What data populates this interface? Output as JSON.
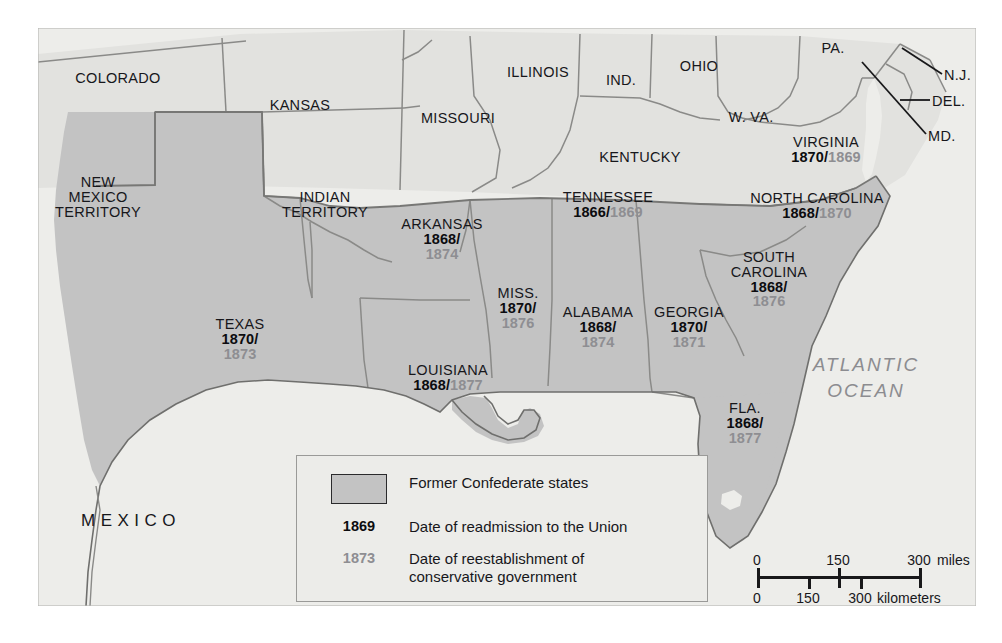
{
  "map": {
    "title": "Reconstruction: Former Confederate States",
    "colors": {
      "confederate_fill": "#c3c3c3",
      "union_fill": "#e2e2df",
      "ocean_fill": "#ededea",
      "border_line": "#8a8a88",
      "label_dark": "#17171b",
      "label_gray": "#8e8e92"
    },
    "ocean_label": "ATLANTIC\nOCEAN",
    "ocean_label_lines": [
      "ATLANTIC",
      "OCEAN"
    ],
    "mexico_label": "MEXICO"
  },
  "confederate_states": [
    {
      "name": "VIRGINIA",
      "readmission": "1870",
      "conservative": "1869",
      "layout": "inline"
    },
    {
      "name": "NORTH CAROLINA",
      "readmission": "1868",
      "conservative": "1870",
      "layout": "inline"
    },
    {
      "name": "SOUTH CAROLINA",
      "name_lines": [
        "SOUTH",
        "CAROLINA"
      ],
      "readmission": "1868",
      "conservative": "1876",
      "layout": "stacked"
    },
    {
      "name": "GEORGIA",
      "readmission": "1870",
      "conservative": "1871",
      "layout": "stacked"
    },
    {
      "name": "FLA.",
      "readmission": "1868",
      "conservative": "1877",
      "layout": "stacked"
    },
    {
      "name": "ALABAMA",
      "readmission": "1868",
      "conservative": "1874",
      "layout": "stacked"
    },
    {
      "name": "MISS.",
      "readmission": "1870",
      "conservative": "1876",
      "layout": "stacked"
    },
    {
      "name": "TENNESSEE",
      "readmission": "1866",
      "conservative": "1869",
      "layout": "inline"
    },
    {
      "name": "ARKANSAS",
      "readmission": "1868",
      "conservative": "1874",
      "layout": "stacked"
    },
    {
      "name": "LOUISIANA",
      "readmission": "1868",
      "conservative": "1877",
      "layout": "inline"
    },
    {
      "name": "TEXAS",
      "readmission": "1870",
      "conservative": "1873",
      "layout": "stacked"
    }
  ],
  "other_places": [
    {
      "name": "COLORADO"
    },
    {
      "name": "KANSAS"
    },
    {
      "name": "NEW MEXICO TERRITORY",
      "name_lines": [
        "NEW",
        "MEXICO",
        "TERRITORY"
      ]
    },
    {
      "name": "INDIAN TERRITORY",
      "name_lines": [
        "INDIAN",
        "TERRITORY"
      ]
    },
    {
      "name": "MISSOURI"
    },
    {
      "name": "ILLINOIS"
    },
    {
      "name": "IND."
    },
    {
      "name": "OHIO"
    },
    {
      "name": "KENTUCKY"
    },
    {
      "name": "W. VA."
    },
    {
      "name": "PA."
    },
    {
      "name": "N.J."
    },
    {
      "name": "DEL."
    },
    {
      "name": "MD."
    }
  ],
  "legend": {
    "swatch_label": "Former Confederate states",
    "rows": [
      {
        "key": "1869",
        "key_style": "bold-black",
        "text": "Date of readmission to the Union"
      },
      {
        "key": "1873",
        "key_style": "bold-gray",
        "text": "Date of reestablishment of\nconservative government",
        "text_lines": [
          "Date of reestablishment of",
          "conservative government"
        ]
      }
    ]
  },
  "scale": {
    "miles": {
      "ticks": [
        "0",
        "150",
        "300"
      ],
      "unit": "miles"
    },
    "kilometers": {
      "ticks": [
        "0",
        "150",
        "300"
      ],
      "unit": "kilometers"
    }
  }
}
